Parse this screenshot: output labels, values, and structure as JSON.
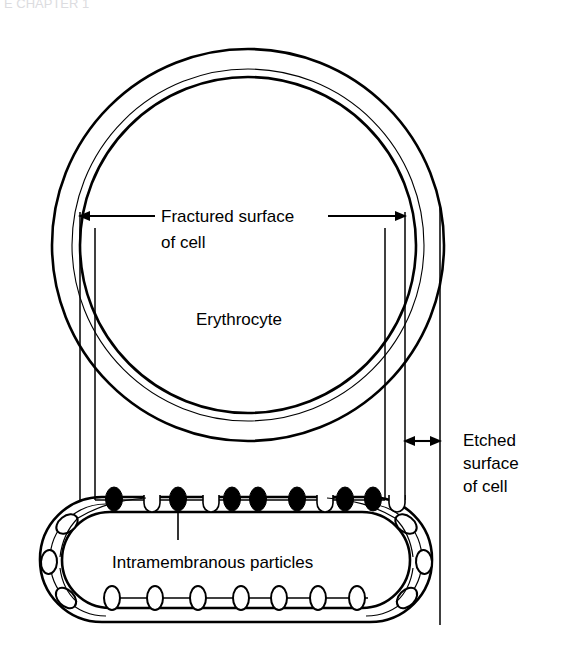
{
  "figure": {
    "title_fragment_top": "E CHAPTER 1",
    "background_color": "#ffffff",
    "line_color": "#000000",
    "particle_fill_color": "#000000",
    "pit_fill_color": "#ffffff"
  },
  "labels": {
    "fractured_surface": {
      "line1": "Fractured surface",
      "line2": "of cell"
    },
    "erythrocyte": "Erythrocyte",
    "etched_surface": {
      "line1": "Etched",
      "line2": "surface",
      "line3": "of cell"
    },
    "intramembranous_particles": "Intramembranous particles"
  },
  "geometry": {
    "cell_circle": {
      "center_x": 248,
      "center_y": 245,
      "outer_radius": 196,
      "middle_radius": 176,
      "inner_radius": 168
    },
    "vertical_lines_x": [
      80,
      95,
      385,
      405,
      440
    ],
    "membrane_block": {
      "left": 40,
      "right": 437,
      "top": 497,
      "bottom": 622,
      "corner_radius": 62
    },
    "fractured_arrow": {
      "y": 216,
      "left_x": 80,
      "right_x": 405
    },
    "etched_arrow": {
      "y": 441,
      "left_x": 405,
      "right_x": 440
    },
    "particles_count": 7,
    "pits_count": 4,
    "bottom_ellipses_count": 7
  }
}
